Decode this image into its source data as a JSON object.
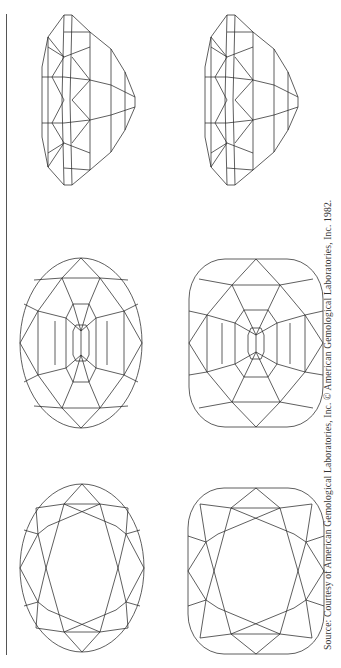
{
  "page": {
    "type": "scanned book figure (rotated 90°)",
    "caption": "Source: Courtesy of American Gemological Laboratories, Inc. © American Gemological Laboratories, Inc. 1982."
  },
  "figures": [
    {
      "id": "oval-side",
      "cut": "oval",
      "view": "side profile"
    },
    {
      "id": "cushion-side",
      "cut": "cushion",
      "view": "side profile"
    },
    {
      "id": "oval-pavilion",
      "cut": "oval",
      "view": "pavilion"
    },
    {
      "id": "cushion-pavilion",
      "cut": "cushion",
      "view": "pavilion"
    },
    {
      "id": "oval-crown",
      "cut": "oval",
      "view": "crown"
    },
    {
      "id": "cushion-crown",
      "cut": "cushion",
      "view": "crown"
    }
  ],
  "colors": {
    "line": "#2a2a2a",
    "background": "#ffffff",
    "rule": "#555555"
  }
}
